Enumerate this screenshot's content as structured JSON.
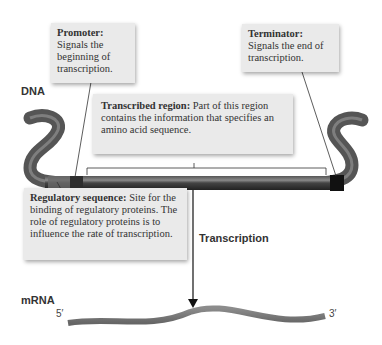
{
  "labels": {
    "dna": "DNA",
    "mrna": "mRNA",
    "transcription": "Transcription",
    "five_prime": "5′",
    "three_prime": "3′"
  },
  "callouts": {
    "promoter": {
      "term": "Promoter:",
      "desc": "Signals the beginning of transcription."
    },
    "terminator": {
      "term": "Terminator:",
      "desc": "Signals the end of transcription."
    },
    "transcribed_region": {
      "term": "Transcribed region:",
      "desc": "Part of this region contains the information that specifies an amino acid sequence."
    },
    "regulatory_sequence": {
      "term": "Regulatory sequence:",
      "desc": "Site for the binding of regulatory proteins. The role of regulatory proteins is to influence the rate of transcription."
    }
  },
  "colors": {
    "callout_bg": "#eaeaea",
    "dna_dark": "#3a3a3a",
    "mrna": "#7a7a7a"
  }
}
